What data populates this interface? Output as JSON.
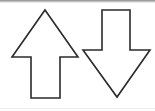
{
  "figure": {
    "stroke_color": "#2a2a2a",
    "fill_color": "#ffffff",
    "arrows": [
      {
        "name": "up-arrow",
        "direction": "up",
        "points": "45,10 78,57 60,57 60,98 31,98 31,57 12,57"
      },
      {
        "name": "down-arrow",
        "direction": "down",
        "points": "102,10 130,10 130,50 150,50 117,97 83,50 102,50"
      }
    ]
  }
}
